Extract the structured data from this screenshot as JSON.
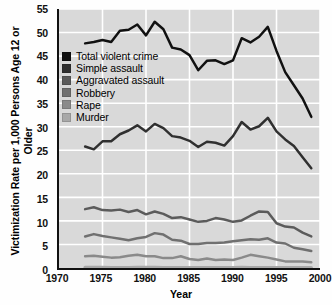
{
  "chart_data": {
    "type": "line",
    "title": "",
    "xlabel": "Year",
    "ylabel": "Victimization Rate per 1,000 Persons Age 12 or Older",
    "xlim": [
      1970,
      2000
    ],
    "ylim": [
      0,
      55
    ],
    "xticks": [
      1970,
      1975,
      1980,
      1985,
      1990,
      1995,
      2000
    ],
    "yticks": [
      0,
      5,
      10,
      15,
      20,
      25,
      30,
      35,
      40,
      45,
      50,
      55
    ],
    "grid": true,
    "grid_color": "#ffffff",
    "plot_background": "#d9d9d9",
    "legend_position": "upper-left-inside",
    "x": [
      1973,
      1974,
      1975,
      1976,
      1977,
      1978,
      1979,
      1980,
      1981,
      1982,
      1983,
      1984,
      1985,
      1986,
      1987,
      1988,
      1989,
      1990,
      1991,
      1992,
      1993,
      1994,
      1995,
      1996,
      1997,
      1998,
      1999
    ],
    "series": [
      {
        "name": "Total violent crime",
        "color": "#111111",
        "values": [
          47.7,
          48.0,
          48.4,
          48.0,
          50.4,
          50.6,
          51.7,
          49.4,
          52.3,
          50.7,
          46.8,
          46.4,
          45.2,
          42.0,
          44.0,
          44.1,
          43.3,
          44.1,
          48.8,
          47.9,
          49.1,
          51.2,
          46.1,
          41.6,
          38.8,
          36.0,
          32.1
        ]
      },
      {
        "name": "Simple assault",
        "color": "#303030",
        "values": [
          25.8,
          25.2,
          26.9,
          26.9,
          28.4,
          29.2,
          30.3,
          29.0,
          30.6,
          29.7,
          28.0,
          27.7,
          27.0,
          25.7,
          26.8,
          26.6,
          26.0,
          28.0,
          31.0,
          29.4,
          30.1,
          31.9,
          29.0,
          27.3,
          25.9,
          23.5,
          21.2
        ]
      },
      {
        "name": "Aggravated assault",
        "color": "#5b5b5b",
        "values": [
          12.5,
          12.9,
          12.3,
          12.2,
          12.4,
          11.9,
          12.3,
          11.4,
          12.0,
          11.5,
          10.6,
          10.8,
          10.3,
          9.8,
          10.0,
          10.6,
          10.3,
          9.8,
          10.1,
          11.1,
          12.0,
          11.9,
          9.5,
          8.8,
          8.6,
          7.5,
          6.7
        ]
      },
      {
        "name": "Robbery",
        "color": "#707070",
        "values": [
          6.7,
          7.2,
          6.8,
          6.5,
          6.2,
          5.9,
          6.3,
          6.6,
          7.4,
          7.1,
          6.0,
          5.8,
          5.1,
          5.1,
          5.3,
          5.3,
          5.4,
          5.7,
          5.9,
          6.1,
          6.0,
          6.3,
          5.4,
          5.2,
          4.3,
          4.0,
          3.6
        ]
      },
      {
        "name": "Rape",
        "color": "#8a8a8a",
        "values": [
          2.5,
          2.6,
          2.4,
          2.2,
          2.3,
          2.6,
          2.8,
          2.5,
          2.5,
          2.1,
          2.1,
          2.5,
          1.9,
          1.7,
          2.0,
          1.7,
          1.8,
          1.7,
          2.2,
          2.8,
          2.5,
          2.2,
          1.8,
          1.4,
          1.4,
          1.4,
          1.2
        ]
      },
      {
        "name": "Murder",
        "color": "#a8a8a8",
        "values": [
          0.1,
          0.1,
          0.1,
          0.09,
          0.09,
          0.09,
          0.1,
          0.1,
          0.1,
          0.09,
          0.08,
          0.08,
          0.08,
          0.09,
          0.08,
          0.08,
          0.09,
          0.09,
          0.1,
          0.09,
          0.09,
          0.09,
          0.08,
          0.07,
          0.07,
          0.06,
          0.06
        ]
      }
    ]
  },
  "axis": {
    "y_title": "Victimization Rate per 1,000 Persons Age 12 or Older",
    "x_title": "Year"
  }
}
